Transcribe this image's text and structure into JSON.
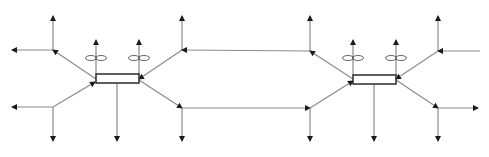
{
  "diagram": {
    "type": "flow-network",
    "colors": {
      "line": "#8a8a8a",
      "arrow": "#1a1a1a",
      "box": "#2a2a2a",
      "background": "#ffffff"
    },
    "groups": [
      {
        "id": "left",
        "box": {
          "x": 96,
          "y": 74,
          "w": 43,
          "h": 9
        },
        "propellers": [
          {
            "cx": 96,
            "cy": 58
          },
          {
            "cx": 139,
            "cy": 58
          }
        ],
        "center_down": {
          "x": 117,
          "y1": 83,
          "y2": 141
        },
        "nodes": {
          "upper_left": {
            "x": 53,
            "y": 50
          },
          "lower_left": {
            "x": 53,
            "y": 107
          },
          "upper_right": {
            "x": 182,
            "y": 50
          },
          "lower_right": {
            "x": 182,
            "y": 108
          }
        }
      },
      {
        "id": "right",
        "box": {
          "x": 353,
          "y": 75,
          "w": 43,
          "h": 9
        },
        "propellers": [
          {
            "cx": 353,
            "cy": 58
          },
          {
            "cx": 396,
            "cy": 58
          }
        ],
        "center_down": {
          "x": 374,
          "y1": 84,
          "y2": 141
        },
        "nodes": {
          "upper_left": {
            "x": 310,
            "y": 51
          },
          "lower_left": {
            "x": 310,
            "y": 108
          },
          "upper_right": {
            "x": 438,
            "y": 51
          },
          "lower_right": {
            "x": 438,
            "y": 108
          }
        }
      }
    ],
    "edges": [
      {
        "from": [
          53,
          50
        ],
        "to": [
          53,
          16
        ],
        "arrow_end": true
      },
      {
        "from": [
          53,
          50
        ],
        "to": [
          12,
          50
        ],
        "arrow_end": true
      },
      {
        "from": [
          96,
          79
        ],
        "to": [
          53,
          50
        ],
        "arrow_end": true
      },
      {
        "from": [
          53,
          107
        ],
        "to": [
          12,
          107
        ],
        "arrow_end": true
      },
      {
        "from": [
          53,
          107
        ],
        "to": [
          53,
          141
        ],
        "arrow_end": true
      },
      {
        "from": [
          53,
          107
        ],
        "to": [
          95,
          82
        ],
        "arrow_end": true
      },
      {
        "from": [
          96,
          74
        ],
        "to": [
          96,
          40
        ],
        "arrow_end": true
      },
      {
        "from": [
          139,
          74
        ],
        "to": [
          139,
          40
        ],
        "arrow_end": true
      },
      {
        "from": [
          117,
          83
        ],
        "to": [
          117,
          141
        ],
        "arrow_end": true
      },
      {
        "from": [
          182,
          50
        ],
        "to": [
          182,
          16
        ],
        "arrow_end": true
      },
      {
        "from": [
          182,
          50
        ],
        "to": [
          139,
          79
        ],
        "arrow_end": true
      },
      {
        "from": [
          139,
          80
        ],
        "to": [
          182,
          108
        ],
        "arrow_end": true
      },
      {
        "from": [
          182,
          108
        ],
        "to": [
          182,
          141
        ],
        "arrow_end": true
      },
      {
        "from": [
          310,
          51
        ],
        "to": [
          182,
          50
        ],
        "arrow_end": true
      },
      {
        "from": [
          182,
          108
        ],
        "to": [
          310,
          108
        ],
        "arrow_end": true
      },
      {
        "from": [
          310,
          51
        ],
        "to": [
          310,
          16
        ],
        "arrow_end": true
      },
      {
        "from": [
          353,
          79
        ],
        "to": [
          310,
          51
        ],
        "arrow_end": true
      },
      {
        "from": [
          310,
          108
        ],
        "to": [
          353,
          81
        ],
        "arrow_end": true
      },
      {
        "from": [
          310,
          108
        ],
        "to": [
          310,
          141
        ],
        "arrow_end": true
      },
      {
        "from": [
          353,
          75
        ],
        "to": [
          353,
          40
        ],
        "arrow_end": true
      },
      {
        "from": [
          396,
          75
        ],
        "to": [
          396,
          40
        ],
        "arrow_end": true
      },
      {
        "from": [
          374,
          84
        ],
        "to": [
          374,
          141
        ],
        "arrow_end": true
      },
      {
        "from": [
          438,
          51
        ],
        "to": [
          438,
          16
        ],
        "arrow_end": true
      },
      {
        "from": [
          480,
          51
        ],
        "to": [
          438,
          51
        ],
        "arrow_end": true
      },
      {
        "from": [
          438,
          51
        ],
        "to": [
          396,
          79
        ],
        "arrow_end": true
      },
      {
        "from": [
          396,
          80
        ],
        "to": [
          438,
          108
        ],
        "arrow_end": true
      },
      {
        "from": [
          438,
          108
        ],
        "to": [
          478,
          108
        ],
        "arrow_end": true
      },
      {
        "from": [
          438,
          108
        ],
        "to": [
          438,
          141
        ],
        "arrow_end": true
      }
    ]
  }
}
